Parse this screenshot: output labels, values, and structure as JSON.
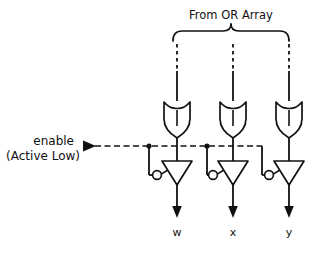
{
  "figure": {
    "title_label": "From OR Array",
    "enable_label_line1": "enable",
    "enable_label_line2": "(Active Low)",
    "outputs": [
      {
        "label": "w"
      },
      {
        "label": "x"
      },
      {
        "label": "y"
      }
    ],
    "gates": [
      {
        "type": "or-gate",
        "name": "or-gate-w"
      },
      {
        "type": "or-gate",
        "name": "or-gate-x"
      },
      {
        "type": "or-gate",
        "name": "or-gate-y"
      }
    ],
    "buffers": [
      {
        "type": "tristate-buffer",
        "name": "tristate-buffer-w"
      },
      {
        "type": "tristate-buffer",
        "name": "tristate-buffer-x"
      },
      {
        "type": "tristate-buffer",
        "name": "tristate-buffer-y"
      }
    ],
    "colors": {
      "ink": "#111111",
      "background": "#ffffff"
    }
  }
}
